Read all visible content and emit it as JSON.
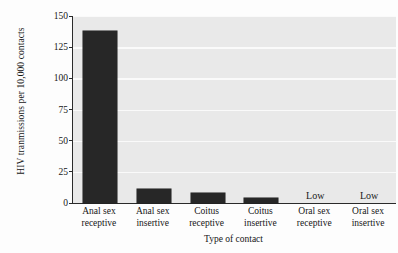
{
  "chart_data": {
    "type": "bar",
    "title": "",
    "xlabel": "Type of contact",
    "ylabel": "HIV tranmissions per 10,000 contacts",
    "categories": [
      "Anal sex receptive",
      "Anal sex insertive",
      "Coitus receptive",
      "Coitus insertive",
      "Oral sex receptive",
      "Oral sex insertive"
    ],
    "category_lines": [
      [
        "Anal sex",
        "receptive"
      ],
      [
        "Anal sex",
        "insertive"
      ],
      [
        "Coitus",
        "receptive"
      ],
      [
        "Coitus",
        "insertive"
      ],
      [
        "Oral sex",
        "receptive"
      ],
      [
        "Oral sex",
        "insertive"
      ]
    ],
    "values": [
      138,
      11,
      8,
      4,
      null,
      null
    ],
    "value_labels": [
      "",
      "",
      "",
      "",
      "Low",
      "Low"
    ],
    "ylim": [
      0,
      150
    ],
    "yticks": [
      0,
      25,
      50,
      75,
      100,
      125,
      150
    ],
    "ytick_labels": [
      "0",
      "25",
      "50",
      "75",
      "100",
      "125",
      "150"
    ],
    "grid": "horizontal",
    "legend": "none",
    "bar_color": "#272727",
    "plot_background": "#e9e9e9",
    "gridline_color": "#fafafa",
    "axis_color": "#2a2a2a"
  }
}
